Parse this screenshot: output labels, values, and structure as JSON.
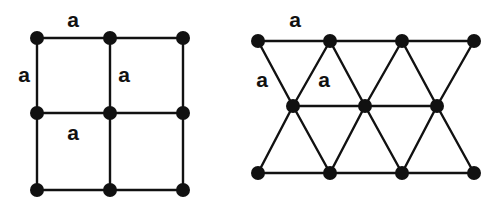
{
  "figure": {
    "background_color": "#ffffff",
    "ink_color": "#111111",
    "width": 500,
    "height": 216
  },
  "square_lattice": {
    "name": "square-lattice",
    "node_radius": 7,
    "edge_width": 2.4,
    "columns_x": [
      37,
      110,
      183
    ],
    "rows_y": [
      38,
      113,
      190
    ],
    "nodes": [
      {
        "id": "sq-n00",
        "x": 37,
        "y": 38
      },
      {
        "id": "sq-n10",
        "x": 110,
        "y": 38
      },
      {
        "id": "sq-n20",
        "x": 183,
        "y": 38
      },
      {
        "id": "sq-n01",
        "x": 37,
        "y": 113
      },
      {
        "id": "sq-n11",
        "x": 110,
        "y": 113
      },
      {
        "id": "sq-n21",
        "x": 183,
        "y": 113
      },
      {
        "id": "sq-n02",
        "x": 37,
        "y": 190
      },
      {
        "id": "sq-n12",
        "x": 110,
        "y": 190
      },
      {
        "id": "sq-n22",
        "x": 183,
        "y": 190
      }
    ],
    "edges": [
      {
        "id": "sq-e-top",
        "x1": 37,
        "y1": 38,
        "x2": 183,
        "y2": 38
      },
      {
        "id": "sq-e-mid-h",
        "x1": 37,
        "y1": 113,
        "x2": 183,
        "y2": 113
      },
      {
        "id": "sq-e-bot",
        "x1": 37,
        "y1": 190,
        "x2": 183,
        "y2": 190
      },
      {
        "id": "sq-e-left",
        "x1": 37,
        "y1": 38,
        "x2": 37,
        "y2": 190
      },
      {
        "id": "sq-e-mid-v",
        "x1": 110,
        "y1": 38,
        "x2": 110,
        "y2": 190
      },
      {
        "id": "sq-e-right",
        "x1": 183,
        "y1": 38,
        "x2": 183,
        "y2": 190
      }
    ],
    "labels": [
      {
        "id": "sq-label-top",
        "text": "a",
        "x": 73,
        "y": 21
      },
      {
        "id": "sq-label-left",
        "text": "a",
        "x": 24,
        "y": 76
      },
      {
        "id": "sq-label-inner",
        "text": "a",
        "x": 124,
        "y": 76
      },
      {
        "id": "sq-label-bottom",
        "text": "a",
        "x": 73,
        "y": 134
      }
    ]
  },
  "triangular_lattice": {
    "name": "triangular-lattice",
    "node_radius": 7,
    "edge_width": 2.4,
    "top_row_x": [
      258,
      330,
      402,
      474
    ],
    "middle_row_x": [
      293,
      365,
      437
    ],
    "bottom_row_x": [
      258,
      330,
      402,
      474
    ],
    "top_row_y": 41,
    "middle_row_y": 106,
    "bottom_row_y": 173,
    "nodes": [
      {
        "id": "tr-t0",
        "x": 258,
        "y": 41
      },
      {
        "id": "tr-t1",
        "x": 330,
        "y": 41
      },
      {
        "id": "tr-t2",
        "x": 402,
        "y": 41
      },
      {
        "id": "tr-t3",
        "x": 474,
        "y": 41
      },
      {
        "id": "tr-m0",
        "x": 293,
        "y": 106
      },
      {
        "id": "tr-m1",
        "x": 365,
        "y": 106
      },
      {
        "id": "tr-m2",
        "x": 437,
        "y": 106
      },
      {
        "id": "tr-b0",
        "x": 258,
        "y": 173
      },
      {
        "id": "tr-b1",
        "x": 330,
        "y": 173
      },
      {
        "id": "tr-b2",
        "x": 402,
        "y": 173
      },
      {
        "id": "tr-b3",
        "x": 474,
        "y": 173
      }
    ],
    "edges": [
      {
        "id": "tr-e-top-row",
        "x1": 258,
        "y1": 41,
        "x2": 474,
        "y2": 41
      },
      {
        "id": "tr-e-mid-row",
        "x1": 293,
        "y1": 106,
        "x2": 437,
        "y2": 106
      },
      {
        "id": "tr-e-bot-row",
        "x1": 258,
        "y1": 173,
        "x2": 474,
        "y2": 173
      },
      {
        "id": "tr-e-d1",
        "x1": 258,
        "y1": 41,
        "x2": 293,
        "y2": 106
      },
      {
        "id": "tr-e-d2",
        "x1": 330,
        "y1": 41,
        "x2": 293,
        "y2": 106
      },
      {
        "id": "tr-e-d3",
        "x1": 330,
        "y1": 41,
        "x2": 365,
        "y2": 106
      },
      {
        "id": "tr-e-d4",
        "x1": 402,
        "y1": 41,
        "x2": 365,
        "y2": 106
      },
      {
        "id": "tr-e-d5",
        "x1": 402,
        "y1": 41,
        "x2": 437,
        "y2": 106
      },
      {
        "id": "tr-e-d6",
        "x1": 474,
        "y1": 41,
        "x2": 437,
        "y2": 106
      },
      {
        "id": "tr-e-d7",
        "x1": 293,
        "y1": 106,
        "x2": 258,
        "y2": 173
      },
      {
        "id": "tr-e-d8",
        "x1": 293,
        "y1": 106,
        "x2": 330,
        "y2": 173
      },
      {
        "id": "tr-e-d9",
        "x1": 365,
        "y1": 106,
        "x2": 330,
        "y2": 173
      },
      {
        "id": "tr-e-d10",
        "x1": 365,
        "y1": 106,
        "x2": 402,
        "y2": 173
      },
      {
        "id": "tr-e-d11",
        "x1": 437,
        "y1": 106,
        "x2": 402,
        "y2": 173
      },
      {
        "id": "tr-e-d12",
        "x1": 437,
        "y1": 106,
        "x2": 474,
        "y2": 173
      }
    ],
    "labels": [
      {
        "id": "tr-label-top",
        "text": "a",
        "x": 295,
        "y": 21
      },
      {
        "id": "tr-label-left",
        "text": "a",
        "x": 262,
        "y": 81
      },
      {
        "id": "tr-label-inner",
        "text": "a",
        "x": 324,
        "y": 81
      }
    ]
  }
}
